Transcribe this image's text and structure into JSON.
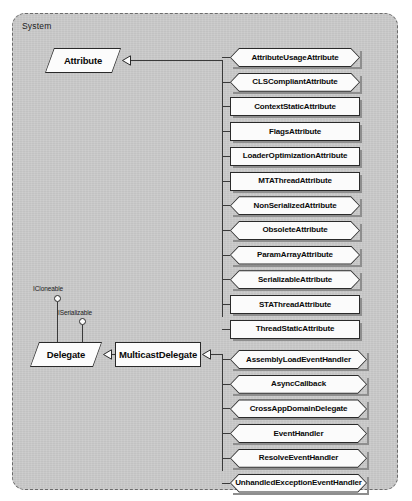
{
  "diagram": {
    "package_label": "System",
    "type": "uml-class-diagram",
    "colors": {
      "package_fill": "#cbcbcb",
      "box_fill": "#fbfbfb",
      "line": "#2a2a2a",
      "page_background": "#ffffff"
    }
  },
  "classes": {
    "attribute": {
      "label": "Attribute",
      "shape": "parallelogram"
    },
    "delegate": {
      "label": "Delegate",
      "shape": "parallelogram"
    },
    "multicast_delegate": {
      "label": "MulticastDelegate",
      "shape": "rectangle"
    }
  },
  "interfaces": [
    {
      "label": "ICloneable",
      "implemented_by": "Delegate"
    },
    {
      "label": "ISerializable",
      "implemented_by": "Delegate"
    }
  ],
  "attribute_subclasses": [
    {
      "label": "AttributeUsageAttribute",
      "shape": "hexagon"
    },
    {
      "label": "CLSCompliantAttribute",
      "shape": "hexagon"
    },
    {
      "label": "ContextStaticAttribute",
      "shape": "rectangle"
    },
    {
      "label": "FlagsAttribute",
      "shape": "rectangle"
    },
    {
      "label": "LoaderOptimizationAttribute",
      "shape": "rectangle"
    },
    {
      "label": "MTAThreadAttribute",
      "shape": "rectangle"
    },
    {
      "label": "NonSerializedAttribute",
      "shape": "hexagon"
    },
    {
      "label": "ObsoleteAttribute",
      "shape": "hexagon"
    },
    {
      "label": "ParamArrayAttribute",
      "shape": "hexagon"
    },
    {
      "label": "SerializableAttribute",
      "shape": "hexagon"
    },
    {
      "label": "STAThreadAttribute",
      "shape": "rectangle"
    },
    {
      "label": "ThreadStaticAttribute",
      "shape": "rectangle"
    }
  ],
  "delegate_subclasses": [
    {
      "label": "AssemblyLoadEventHandler",
      "shape": "hexagon"
    },
    {
      "label": "AsyncCallback",
      "shape": "hexagon"
    },
    {
      "label": "CrossAppDomainDelegate",
      "shape": "hexagon"
    },
    {
      "label": "EventHandler",
      "shape": "hexagon"
    },
    {
      "label": "ResolveEventHandler",
      "shape": "hexagon"
    },
    {
      "label": "UnhandledExceptionEventHandler",
      "shape": "hexagon"
    }
  ]
}
